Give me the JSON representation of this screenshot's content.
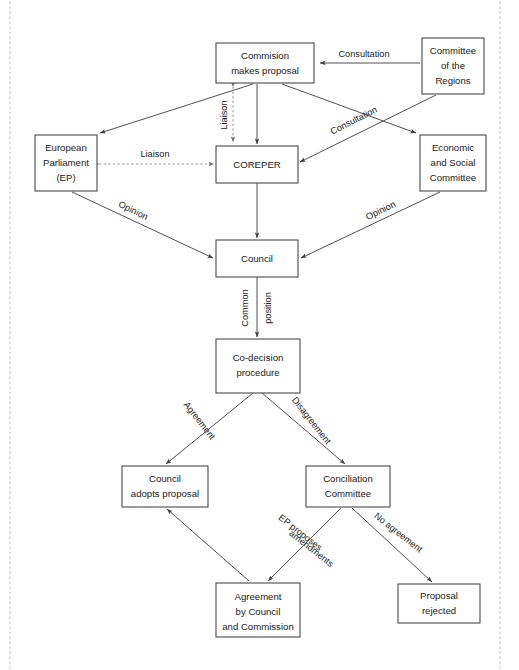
{
  "diagram": {
    "colors": {
      "box_stroke": "#4a4a4a",
      "box_fill": "#ffffff",
      "edge_solid": "#3d3d3d",
      "edge_dashed": "#8a8a8a",
      "text": "#1a1a1a",
      "frame_dots": "#d8d8d8"
    },
    "nodes": [
      {
        "id": "commission",
        "lines": [
          "Commision",
          "makes proposal"
        ],
        "x": 216,
        "y": 43,
        "w": 98,
        "h": 40
      },
      {
        "id": "committee_regions",
        "lines": [
          "Committee",
          "of the",
          "Regions"
        ],
        "x": 422,
        "y": 38,
        "w": 62,
        "h": 56
      },
      {
        "id": "european_parliament",
        "lines": [
          "European",
          "Parliament",
          "(EP)"
        ],
        "x": 35,
        "y": 135,
        "w": 62,
        "h": 56
      },
      {
        "id": "coreper",
        "lines": [
          "COREPER"
        ],
        "x": 216,
        "y": 146,
        "w": 82,
        "h": 37
      },
      {
        "id": "economic_social",
        "lines": [
          "Economic",
          "and Social",
          "Committee"
        ],
        "x": 420,
        "y": 135,
        "w": 66,
        "h": 56
      },
      {
        "id": "council",
        "lines": [
          "Council"
        ],
        "x": 216,
        "y": 240,
        "w": 82,
        "h": 37
      },
      {
        "id": "codecision",
        "lines": [
          "Co-decision",
          "procedure"
        ],
        "x": 216,
        "y": 339,
        "w": 84,
        "h": 54
      },
      {
        "id": "council_adopts",
        "lines": [
          "Council",
          "adopts proposal"
        ],
        "x": 122,
        "y": 466,
        "w": 86,
        "h": 41
      },
      {
        "id": "conciliation",
        "lines": [
          "Conciliation",
          "Committee"
        ],
        "x": 306,
        "y": 466,
        "w": 84,
        "h": 41
      },
      {
        "id": "agreement_cc",
        "lines": [
          "Agreement",
          "by Council",
          "and Commission"
        ],
        "x": 216,
        "y": 583,
        "w": 84,
        "h": 54
      },
      {
        "id": "proposal_rejected",
        "lines": [
          "Proposal",
          "rejected"
        ],
        "x": 398,
        "y": 584,
        "w": 82,
        "h": 39
      }
    ],
    "edges": [
      {
        "id": "regions-to-commission",
        "label": "Consultation",
        "style": "solid",
        "rotation": 0
      },
      {
        "id": "commission-to-ep",
        "label": "",
        "style": "solid",
        "rotation": 0
      },
      {
        "id": "commission-to-coreper",
        "label": "",
        "style": "solid",
        "rotation": 0
      },
      {
        "id": "coreper-commission-liaison",
        "label": "Liaison",
        "style": "dashed",
        "rotation": -90
      },
      {
        "id": "ep-coreper-liaison",
        "label": "Liaison",
        "style": "dashed",
        "rotation": 0
      },
      {
        "id": "commission-to-economic",
        "label": "Consultation",
        "style": "solid",
        "rotation": -27
      },
      {
        "id": "regions-to-coreper",
        "label": "",
        "style": "solid",
        "rotation": 0
      },
      {
        "id": "ep-to-council",
        "label": "Opinion",
        "style": "solid",
        "rotation": 26
      },
      {
        "id": "economic-to-council",
        "label": "Opinion",
        "style": "solid",
        "rotation": -26
      },
      {
        "id": "coreper-to-council",
        "label": "",
        "style": "solid",
        "rotation": 0
      },
      {
        "id": "council-to-codecision",
        "label": "Common position",
        "style": "solid",
        "rotation": -90
      },
      {
        "id": "codecision-to-adopts",
        "label": "Agreement",
        "style": "solid",
        "rotation": 52
      },
      {
        "id": "codecision-to-conciliation",
        "label": "Disagreement",
        "style": "solid",
        "rotation": 52
      },
      {
        "id": "conciliation-to-agreement",
        "label": "EP proposes amendments",
        "style": "solid",
        "rotation": 38
      },
      {
        "id": "conciliation-to-rejected",
        "label": "No agreement",
        "style": "solid",
        "rotation": 38
      },
      {
        "id": "agreement-to-adopts",
        "label": "",
        "style": "solid",
        "rotation": 0
      }
    ],
    "edge_labels": {
      "consultation_regions": "Consultation",
      "consultation_economic": "Consultation",
      "liaison_vertical": "Liaison",
      "liaison_horizontal": "Liaison",
      "opinion_left": "Opinion",
      "opinion_right": "Opinion",
      "common": "Common",
      "position": "position",
      "agreement": "Agreement",
      "disagreement": "Disagreement",
      "ep_proposes": "EP proposes",
      "amendments": "amendments",
      "no_agreement": "No agreement"
    },
    "node_text": {
      "commission_l1": "Commision",
      "commission_l2": "makes proposal",
      "regions_l1": "Committee",
      "regions_l2": "of the",
      "regions_l3": "Regions",
      "ep_l1": "European",
      "ep_l2": "Parliament",
      "ep_l3": "(EP)",
      "coreper_l1": "COREPER",
      "economic_l1": "Economic",
      "economic_l2": "and Social",
      "economic_l3": "Committee",
      "council_l1": "Council",
      "codecision_l1": "Co-decision",
      "codecision_l2": "procedure",
      "adopts_l1": "Council",
      "adopts_l2": "adopts proposal",
      "conciliation_l1": "Conciliation",
      "conciliation_l2": "Committee",
      "agreement_l1": "Agreement",
      "agreement_l2": "by Council",
      "agreement_l3": "and Commission",
      "rejected_l1": "Proposal",
      "rejected_l2": "rejected"
    }
  }
}
